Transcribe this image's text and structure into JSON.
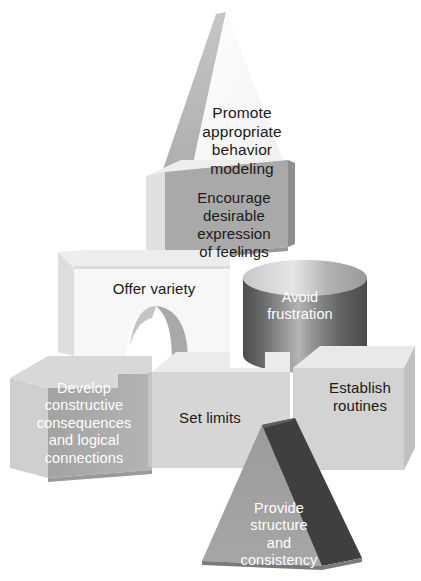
{
  "image": {
    "kind": "3d-building-blocks-diagram",
    "title_visible": false,
    "background_color": "#ffffff",
    "palette": {
      "white_block": "#fdfdfd",
      "light_gray": "#e9e9e9",
      "mid_gray": "#bdbdbd",
      "gray": "#a8a8a8",
      "dark_gray": "#4a4a4a",
      "text_dark": "#1a1a1a",
      "text_light": "#ffffff"
    }
  },
  "blocks": [
    {
      "id": "promote",
      "shape": "triangle-prism",
      "label": "Promote\nappropriate\nbehavior\nmodeling",
      "text_color": "#1a1a1a",
      "face_color": "#fafafa",
      "side_color": "#b9b9b9",
      "row": "top"
    },
    {
      "id": "encourage",
      "shape": "cube",
      "label": "Encourage\ndesirable\nexpression\nof feelings",
      "text_color": "#1a1a1a",
      "face_color": "#a9a9a9",
      "side_color": "#e4e4e4",
      "row": "second"
    },
    {
      "id": "offer-variety",
      "shape": "arch-block",
      "label": "Offer variety",
      "text_color": "#1a1a1a",
      "face_color": "#f6f6f6",
      "side_color": "#e2e2e2",
      "row": "third"
    },
    {
      "id": "avoid-frustration",
      "shape": "cylinder",
      "label": "Avoid\nfrustration",
      "text_color": "#ffffff",
      "face_color": "#6d6d6d",
      "side_color": "#c9c9c9",
      "row": "third"
    },
    {
      "id": "develop-consequences",
      "shape": "cube",
      "label": "Develop\nconstructive\nconsequences\nand logical\nconnections",
      "text_color": "#ffffff",
      "face_color": "#ababab",
      "side_color": "#d9d9d9",
      "row": "bottom"
    },
    {
      "id": "set-limits",
      "shape": "cube",
      "label": "Set limits",
      "text_color": "#1a1a1a",
      "face_color": "#d6d6d6",
      "side_color": "#ededed",
      "row": "bottom"
    },
    {
      "id": "establish-routines",
      "shape": "cube",
      "label": "Establish\nroutines",
      "text_color": "#1a1a1a",
      "face_color": "#d3d3d3",
      "side_color": "#eaeaea",
      "row": "bottom"
    },
    {
      "id": "provide-structure",
      "shape": "triangle-prism",
      "label": "Provide\nstructure\nand\nconsistency",
      "text_color": "#ffffff",
      "face_color": "#9e9e9e",
      "side_color": "#3f3f3f",
      "row": "foreground"
    }
  ]
}
